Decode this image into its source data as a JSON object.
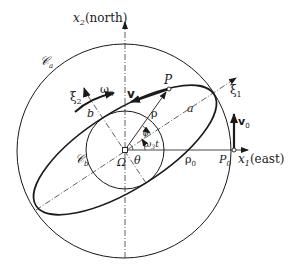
{
  "diagram": {
    "type": "geometry-figure",
    "colors": {
      "ink": "#1a1a1a",
      "background": "#ffffff"
    },
    "axes": {
      "x1": {
        "label": "x",
        "subscript": "1",
        "suffix": "(east)"
      },
      "x2": {
        "label": "x",
        "subscript": "2",
        "suffix": "(north)"
      },
      "xi1": {
        "label": "ξ",
        "subscript": "1"
      },
      "xi2": {
        "label": "ξ",
        "subscript": "2"
      }
    },
    "curves": {
      "outer_circle": {
        "label": "𝒞",
        "subscript": "a"
      },
      "inner_circle": {
        "label": "𝒞",
        "subscript": "b"
      },
      "ellipse_semi_major": "a",
      "ellipse_semi_minor": "b"
    },
    "points": {
      "center": "Ω",
      "P": "P",
      "P0": {
        "label": "P",
        "subscript": "0"
      }
    },
    "vectors": {
      "v": "v",
      "v0": {
        "label": "v",
        "subscript": "0"
      },
      "rho": "ρ",
      "rho0": {
        "label": "ρ",
        "subscript": "0"
      }
    },
    "angles": {
      "theta": "θ",
      "psi": "ψ",
      "omega3t": {
        "label": "ω",
        "subscript": "3",
        "suffix": "t"
      }
    },
    "rotation": {
      "label": "ω",
      "subscript": "3"
    }
  }
}
